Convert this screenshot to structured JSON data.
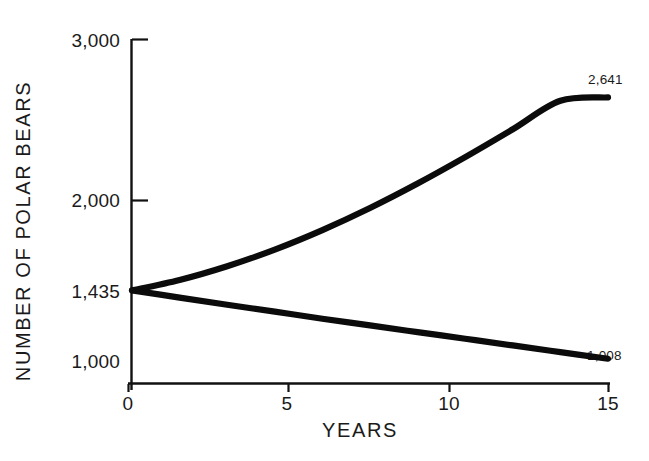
{
  "chart_data": {
    "type": "line",
    "title": "",
    "xlabel": "YEARS",
    "ylabel": "NUMBER OF POLAR BEARS",
    "xlim": [
      0,
      15
    ],
    "ylim": [
      780,
      3000
    ],
    "grid": false,
    "legend": "none",
    "x_ticks": [
      {
        "value": 0,
        "label": "0"
      },
      {
        "value": 5,
        "label": "5"
      },
      {
        "value": 10,
        "label": "10"
      },
      {
        "value": 15,
        "label": "15"
      }
    ],
    "y_ticks": [
      {
        "value": 3000,
        "label": "3,000",
        "has_tick_mark": true
      },
      {
        "value": 2000,
        "label": "2,000",
        "has_tick_mark": true
      },
      {
        "value": 1435,
        "label": "1,435",
        "has_tick_mark": false
      },
      {
        "value": 1000,
        "label": "1,000",
        "has_tick_mark": false
      }
    ],
    "start_value": 1435,
    "series": [
      {
        "name": "increasing-population",
        "x": [
          0,
          1.5,
          3,
          4.5,
          6,
          7.5,
          9,
          10.5,
          12,
          13.5,
          15
        ],
        "values": [
          1435,
          1500,
          1586,
          1690,
          1812,
          1950,
          2103,
          2268,
          2442,
          2620,
          2641
        ],
        "end_label": "2,641"
      },
      {
        "name": "decreasing-population",
        "x": [
          0,
          1.5,
          3,
          4.5,
          6,
          7.5,
          9,
          10.5,
          12,
          13.5,
          15
        ],
        "values": [
          1435,
          1390,
          1345,
          1302,
          1258,
          1216,
          1174,
          1133,
          1091,
          1049,
          1008
        ],
        "end_label": "1,008"
      }
    ],
    "annotations": [
      {
        "text": "2,641",
        "series": "increasing-population",
        "at_x": 15
      },
      {
        "text": "1,008",
        "series": "decreasing-population",
        "at_x": 15
      }
    ],
    "colors": {
      "line": "#0b0b0b",
      "axis": "#111111",
      "text": "#1a1a1a",
      "background": "#ffffff"
    }
  }
}
